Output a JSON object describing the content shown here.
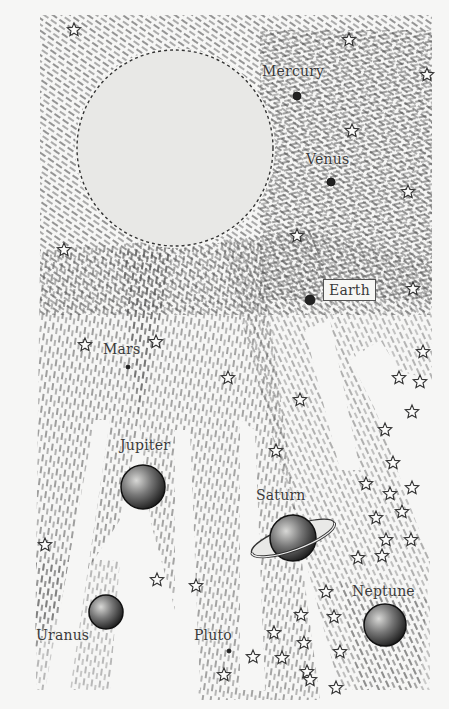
{
  "illustration": {
    "subject": "Solar system drawing",
    "colors": {
      "background": "#f6f6f5",
      "sun": "#e8e8e6",
      "ink": "#2e2e2e",
      "hatch": "#4a4a4a"
    },
    "sun": {
      "cx": 175,
      "cy": 148,
      "r": 98
    }
  },
  "planets": [
    {
      "id": "mercury",
      "label": "Mercury",
      "cx": 297,
      "cy": 96,
      "r": 4,
      "label_x": 262,
      "label_y": 64,
      "boxed": false
    },
    {
      "id": "venus",
      "label": "Venus",
      "cx": 331,
      "cy": 182,
      "r": 4,
      "label_x": 306,
      "label_y": 152,
      "boxed": false
    },
    {
      "id": "earth",
      "label": "Earth",
      "cx": 310,
      "cy": 300,
      "r": 5,
      "label_x": 323,
      "label_y": 279,
      "boxed": true
    },
    {
      "id": "mars",
      "label": "Mars",
      "cx": 128,
      "cy": 367,
      "r": 2,
      "label_x": 103,
      "label_y": 342,
      "boxed": false
    },
    {
      "id": "jupiter",
      "label": "Jupiter",
      "cx": 143,
      "cy": 487,
      "r": 22,
      "label_x": 120,
      "label_y": 438,
      "boxed": false
    },
    {
      "id": "saturn",
      "label": "Saturn",
      "cx": 293,
      "cy": 538,
      "r": 23,
      "label_x": 256,
      "label_y": 488,
      "boxed": false
    },
    {
      "id": "uranus",
      "label": "Uranus",
      "cx": 106,
      "cy": 612,
      "r": 17,
      "label_x": 36,
      "label_y": 628,
      "boxed": false
    },
    {
      "id": "pluto",
      "label": "Pluto",
      "cx": 229,
      "cy": 651,
      "r": 2,
      "label_x": 194,
      "label_y": 628,
      "boxed": false
    },
    {
      "id": "neptune",
      "label": "Neptune",
      "cx": 385,
      "cy": 625,
      "r": 21,
      "label_x": 352,
      "label_y": 584,
      "boxed": false
    }
  ],
  "stars": [
    [
      74,
      30
    ],
    [
      349,
      40
    ],
    [
      427,
      75
    ],
    [
      352,
      131
    ],
    [
      408,
      192
    ],
    [
      297,
      236
    ],
    [
      64,
      250
    ],
    [
      413,
      289
    ],
    [
      85,
      345
    ],
    [
      156,
      342
    ],
    [
      228,
      378
    ],
    [
      423,
      352
    ],
    [
      399,
      378
    ],
    [
      420,
      382
    ],
    [
      300,
      400
    ],
    [
      412,
      412
    ],
    [
      385,
      430
    ],
    [
      276,
      451
    ],
    [
      393,
      463
    ],
    [
      366,
      484
    ],
    [
      390,
      494
    ],
    [
      412,
      488
    ],
    [
      376,
      518
    ],
    [
      402,
      512
    ],
    [
      411,
      540
    ],
    [
      386,
      540
    ],
    [
      358,
      558
    ],
    [
      382,
      556
    ],
    [
      45,
      545
    ],
    [
      157,
      580
    ],
    [
      196,
      586
    ],
    [
      326,
      592
    ],
    [
      301,
      615
    ],
    [
      334,
      617
    ],
    [
      274,
      633
    ],
    [
      253,
      657
    ],
    [
      282,
      658
    ],
    [
      304,
      643
    ],
    [
      307,
      672
    ],
    [
      340,
      652
    ],
    [
      224,
      675
    ],
    [
      310,
      680
    ],
    [
      336,
      688
    ]
  ]
}
